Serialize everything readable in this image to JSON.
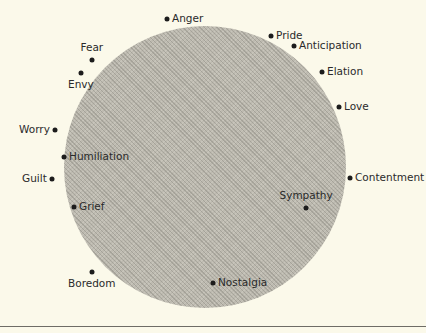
{
  "diagram": {
    "circle": {
      "cx": 205,
      "cy": 167,
      "r": 141,
      "fill": "#bdbab0"
    },
    "rule_y": 326,
    "points": [
      {
        "label": "Anger",
        "x": 167,
        "y": 19,
        "pos": "right"
      },
      {
        "label": "Pride",
        "x": 271,
        "y": 36,
        "pos": "right"
      },
      {
        "label": "Anticipation",
        "x": 294,
        "y": 46,
        "pos": "right"
      },
      {
        "label": "Elation",
        "x": 322,
        "y": 72,
        "pos": "right"
      },
      {
        "label": "Love",
        "x": 339,
        "y": 107,
        "pos": "right"
      },
      {
        "label": "Fear",
        "x": 92,
        "y": 60,
        "pos": "above"
      },
      {
        "label": "Envy",
        "x": 81,
        "y": 73,
        "pos": "below"
      },
      {
        "label": "Worry",
        "x": 55,
        "y": 130,
        "pos": "left"
      },
      {
        "label": "Humiliation",
        "x": 64,
        "y": 157,
        "pos": "right"
      },
      {
        "label": "Guilt",
        "x": 52,
        "y": 179,
        "pos": "left"
      },
      {
        "label": "Grief",
        "x": 74,
        "y": 207,
        "pos": "right"
      },
      {
        "label": "Contentment",
        "x": 350,
        "y": 178,
        "pos": "right"
      },
      {
        "label": "Sympathy",
        "x": 306,
        "y": 208,
        "pos": "above"
      },
      {
        "label": "Boredom",
        "x": 92,
        "y": 272,
        "pos": "below"
      },
      {
        "label": "Nostalgia",
        "x": 213,
        "y": 283,
        "pos": "right"
      }
    ]
  }
}
